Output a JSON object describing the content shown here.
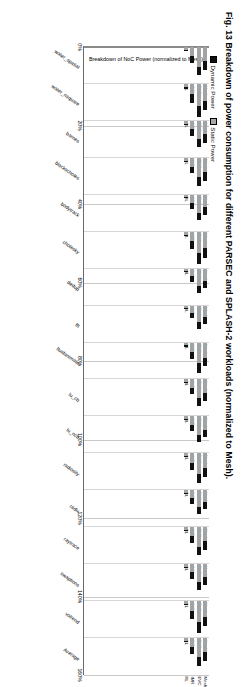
{
  "figure": {
    "caption_prefix": "Fig. 13",
    "caption_text": "Breakdown of power consumption for different PARSEC and SPLASH-2 workloads (normalized to Mesh)."
  },
  "chart_data": {
    "type": "bar",
    "orientation": "vertical-grouped-rotated",
    "title": "",
    "xlabel": "",
    "ylabel": "Breakdown of NoC Power (normalized to Mesh)",
    "ylim": [
      0,
      160
    ],
    "ytick_labels": [
      "0%",
      "20%",
      "40%",
      "60%",
      "80%",
      "100%",
      "120%",
      "140%",
      "160%"
    ],
    "ytick_values": [
      0,
      20,
      40,
      60,
      80,
      100,
      120,
      140,
      160
    ],
    "grid": true,
    "legend_position": "top-left",
    "legend": [
      {
        "name": "Dynamic Power",
        "color": "#111111"
      },
      {
        "name": "Static Power",
        "color": "#a3a3a3"
      }
    ],
    "bar_labels": [
      "Mesh",
      "EVC",
      "IMR",
      "RL"
    ],
    "categories": [
      "water_spatial",
      "water_nsquare",
      "barnes",
      "blackscholes",
      "bodytrack",
      "cholesky",
      "dedup",
      "fft",
      "fluidanimate",
      "lu_cb",
      "lu_ncb",
      "radiosity",
      "radix",
      "raytrace",
      "swaptions",
      "volrend",
      "Average"
    ],
    "series": [
      {
        "name": "Static Power",
        "values": [
          [
            62,
            86,
            40,
            13
          ],
          [
            72,
            96,
            44,
            14
          ],
          [
            58,
            80,
            36,
            12
          ],
          [
            60,
            84,
            38,
            12
          ],
          [
            55,
            78,
            35,
            11
          ],
          [
            70,
            92,
            42,
            13
          ],
          [
            54,
            76,
            34,
            11
          ],
          [
            50,
            72,
            32,
            10
          ],
          [
            66,
            90,
            40,
            13
          ],
          [
            58,
            82,
            37,
            12
          ],
          [
            57,
            80,
            36,
            12
          ],
          [
            64,
            88,
            40,
            13
          ],
          [
            52,
            74,
            33,
            11
          ],
          [
            60,
            84,
            38,
            12
          ],
          [
            56,
            79,
            36,
            12
          ],
          [
            68,
            92,
            42,
            13
          ],
          [
            60,
            84,
            38,
            12
          ]
        ]
      },
      {
        "name": "Dynamic Power",
        "values": [
          [
            38,
            37,
            31,
            5
          ],
          [
            40,
            48,
            38,
            6
          ],
          [
            36,
            34,
            28,
            5
          ],
          [
            40,
            40,
            30,
            5
          ],
          [
            33,
            32,
            27,
            4
          ],
          [
            42,
            46,
            34,
            6
          ],
          [
            32,
            30,
            26,
            4
          ],
          [
            30,
            28,
            24,
            4
          ],
          [
            38,
            42,
            33,
            5
          ],
          [
            35,
            34,
            28,
            5
          ],
          [
            34,
            33,
            28,
            5
          ],
          [
            38,
            40,
            31,
            5
          ],
          [
            31,
            29,
            25,
            4
          ],
          [
            40,
            38,
            30,
            5
          ],
          [
            35,
            34,
            28,
            5
          ],
          [
            42,
            46,
            34,
            6
          ],
          [
            38,
            38,
            30,
            5
          ]
        ]
      }
    ]
  }
}
